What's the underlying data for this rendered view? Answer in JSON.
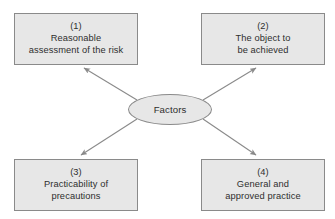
{
  "diagram": {
    "type": "hub-and-spoke",
    "center": {
      "label": "Factors",
      "shape": "ellipse"
    },
    "nodes": [
      {
        "number": "(1)",
        "lines": [
          "Reasonable",
          "assessment of the risk"
        ],
        "position": "top-left"
      },
      {
        "number": "(2)",
        "lines": [
          "The object to",
          "be achieved"
        ],
        "position": "top-right"
      },
      {
        "number": "(3)",
        "lines": [
          "Practicability of",
          "precautions"
        ],
        "position": "bottom-left"
      },
      {
        "number": "(4)",
        "lines": [
          "General and",
          "approved practice"
        ],
        "position": "bottom-right"
      }
    ],
    "connectors": [
      {
        "from": "center",
        "to": "(1)",
        "arrowhead": "end"
      },
      {
        "from": "center",
        "to": "(2)",
        "arrowhead": "end"
      },
      {
        "from": "center",
        "to": "(3)",
        "arrowhead": "end"
      },
      {
        "from": "center",
        "to": "(4)",
        "arrowhead": "end"
      }
    ],
    "colors": {
      "node_fill": "#e7e7e7",
      "node_border": "#8a8a8a",
      "text": "#2e2e2e",
      "connector": "#8a8a8a",
      "background": "#ffffff"
    }
  }
}
